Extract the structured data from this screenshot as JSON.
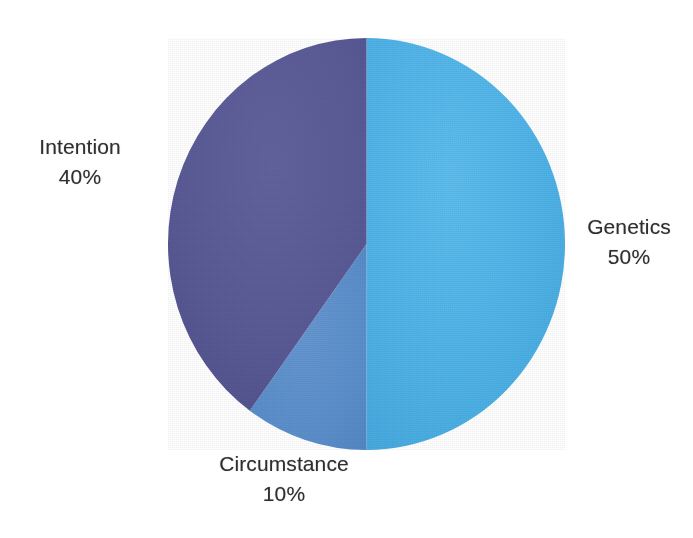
{
  "figure": {
    "kind": "pie-chart",
    "background_color": "#FFFFFF",
    "label_text_color": "#2F2F31"
  },
  "chart_data": {
    "type": "pie",
    "title": "",
    "subtitle": "",
    "xlabel": "",
    "ylabel": "",
    "grid": false,
    "legend": "none",
    "labels_position": "outside",
    "total": 100,
    "units": "%",
    "start_angle_deg": 0,
    "direction": "clockwise",
    "categories": [
      "Genetics",
      "Circumstance",
      "Intention"
    ],
    "values": [
      50,
      10,
      40
    ],
    "colors": [
      "#4FB3E8",
      "#5B8FCB",
      "#5A5A96"
    ],
    "slices": [
      {
        "name": "Genetics",
        "value": 50,
        "value_label": "50%",
        "color": "#4FB3E8",
        "start_angle_deg": 0,
        "end_angle_deg": 180
      },
      {
        "name": "Circumstance",
        "value": 10,
        "value_label": "10%",
        "color": "#5B8FCB",
        "start_angle_deg": 180,
        "end_angle_deg": 216
      },
      {
        "name": "Intention",
        "value": 40,
        "value_label": "40%",
        "color": "#5A5A96",
        "start_angle_deg": 216,
        "end_angle_deg": 360
      }
    ]
  },
  "labels": {
    "intention": {
      "name": "Intention",
      "value": "40%"
    },
    "genetics": {
      "name": "Genetics",
      "value": "50%"
    },
    "circumstance": {
      "name": "Circumstance",
      "value": "10%"
    }
  }
}
